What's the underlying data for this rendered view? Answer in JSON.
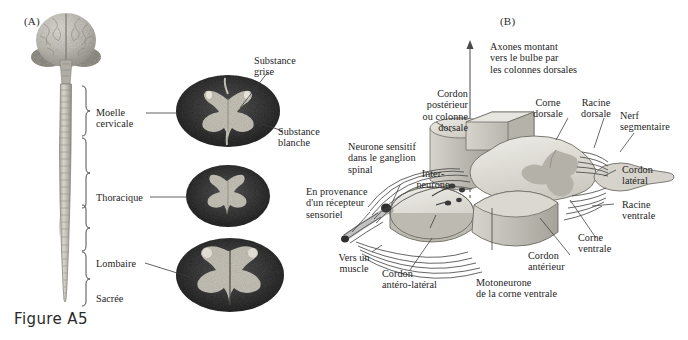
{
  "figure": {
    "caption": "Figure A5",
    "background": "#ffffff",
    "panels": [
      {
        "tag": "(A)",
        "name": "spinal-cord-levels-panel"
      },
      {
        "tag": "(B)",
        "name": "spinal-segment-circuit-panel"
      }
    ]
  },
  "panel_a": {
    "tag": "(A)",
    "level_labels": [
      {
        "id": "cervical",
        "text": "Moelle\ncervicale"
      },
      {
        "id": "thoracic",
        "text": "Thoracique"
      },
      {
        "id": "lumbar",
        "text": "Lombaire"
      },
      {
        "id": "sacral",
        "text": "Sacrée"
      }
    ],
    "section_labels": [
      {
        "id": "gray-matter",
        "text": "Substance\ngrise"
      },
      {
        "id": "white-matter",
        "text": "Substance\nblanche"
      }
    ],
    "cross_sections": [
      {
        "id": "cervical-section",
        "level": "cervicale"
      },
      {
        "id": "thoracic-section",
        "level": "thoracique"
      },
      {
        "id": "lumbar-section",
        "level": "lombaire"
      }
    ],
    "anatomy": [
      {
        "id": "brain",
        "name": "cerebral-hemispheres"
      },
      {
        "id": "cerebellum",
        "name": "cerebellum"
      },
      {
        "id": "brainstem",
        "name": "brainstem"
      },
      {
        "id": "cord",
        "name": "spinal-cord-column"
      }
    ]
  },
  "panel_b": {
    "tag": "(B)",
    "labels": [
      {
        "id": "ascending-axons",
        "text": "Axones montant\nvers le bulbe par\nles colonnes dorsales"
      },
      {
        "id": "posterior-cord",
        "text": "Cordon\npostérieur\nou colonne\ndorsale"
      },
      {
        "id": "dorsal-horn",
        "text": "Corne\ndorsale"
      },
      {
        "id": "dorsal-root",
        "text": "Racine\ndorsale"
      },
      {
        "id": "segmental-nerve",
        "text": "Nerf\nsegmentaire"
      },
      {
        "id": "lateral-cord",
        "text": "Cordon\nlatéral"
      },
      {
        "id": "ventral-root",
        "text": "Racine\nventrale"
      },
      {
        "id": "ventral-horn",
        "text": "Corne\nventrale"
      },
      {
        "id": "anterior-cord",
        "text": "Cordon\nantérieur"
      },
      {
        "id": "ventral-motoneuron",
        "text": "Motoneurone\nde la corne ventrale"
      },
      {
        "id": "anterolateral-cord",
        "text": "Cordon\nantéro-latéral"
      },
      {
        "id": "to-muscle",
        "text": "Vers un\nmuscle"
      },
      {
        "id": "from-receptor",
        "text": "En provenance\nd'un récepteur\nsensoriel"
      },
      {
        "id": "sensory-neuron",
        "text": "Neurone sensitif\ndans le ganglion\nspinal"
      },
      {
        "id": "interneuron",
        "text": "Inter-\nneurone"
      }
    ]
  },
  "colors": {
    "ink": "#1e1e1e",
    "leader": "#3a3a3a",
    "white_matter": "#3b3b3b",
    "gray_matter": "#c9c6bd",
    "block_light": "#e4e2dc",
    "block_mid": "#c8c5bd",
    "block_dark": "#9e9b93",
    "fiber": "#4a4a4a"
  }
}
